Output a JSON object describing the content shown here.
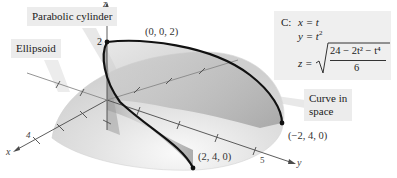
{
  "figure": {
    "type": "3d-surface-intersection",
    "callouts": {
      "parabolic_cylinder": "Parabolic cylinder",
      "ellipsoid": "Ellipsoid",
      "curve_in_space_line1": "Curve in",
      "curve_in_space_line2": "space"
    },
    "points": {
      "top": "(0, 0, 2)",
      "front": "(2, 4, 0)",
      "back": "(−2, 4, 0)"
    },
    "axes": {
      "x_label": "x",
      "y_label": "y",
      "z_label": "z",
      "x_tick": "4",
      "y_tick": "5",
      "z_tick": "2"
    },
    "equations": {
      "curve_name": "C:",
      "x_eq": "x = t",
      "y_eq_base": "y = t",
      "y_eq_exp": "2",
      "z_lhs": "z =",
      "z_numerator": "24 − 2t² − t⁴",
      "z_denominator": "6"
    },
    "colors": {
      "curve": "#111111",
      "surface_light": "#e6e6e6",
      "surface_dark": "#a8a8a8",
      "callout_bg": "#ececec"
    }
  }
}
